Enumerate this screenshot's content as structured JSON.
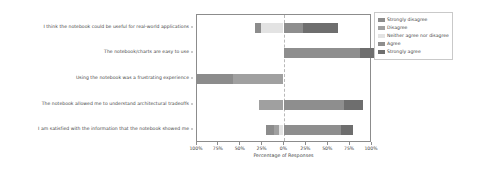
{
  "chart_data": {
    "type": "bar",
    "title": "",
    "subtitle": "",
    "xlabel": "Percentage of Responses",
    "ylabel": "",
    "orientation": "horizontal",
    "stacking": "diverging",
    "grid": false,
    "legend_position": "right",
    "xlim": [
      -100,
      100
    ],
    "xticks": [
      -100,
      -75,
      -50,
      -25,
      0,
      25,
      50,
      75,
      100
    ],
    "xtick_labels": [
      "100%",
      "75%",
      "50%",
      "25%",
      "0%",
      "25%",
      "50%",
      "75%",
      "100%"
    ],
    "center_reference": 0,
    "categories": [
      "I think the notebook could be useful for real-world applications",
      "The notebook/charts are easy to use",
      "Using the notebook was a frustrating experience",
      "The notebook allowed me to understand architectural tradeoffs",
      "I am satisfied with the information that the notebook showed me"
    ],
    "series": [
      {
        "name": "Strongly disagree",
        "color": "#8c8c8c",
        "values": [
          7,
          0,
          42,
          0,
          9
        ]
      },
      {
        "name": "Disagree",
        "color": "#a0a0a0",
        "values": [
          0,
          0,
          58,
          28,
          6
        ]
      },
      {
        "name": "Neither agree nor disagree",
        "color": "#e3e3e3",
        "values": [
          26,
          0,
          0,
          0,
          5
        ]
      },
      {
        "name": "Agree",
        "color": "#8e8e8e",
        "values": [
          23,
          89,
          0,
          70,
          67
        ]
      },
      {
        "name": "Strongly agree",
        "color": "#6e6e6e",
        "values": [
          40,
          18,
          0,
          22,
          13
        ]
      }
    ],
    "bars": [
      {
        "category": "I think the notebook could be useful for real-world applications",
        "segments": [
          {
            "label": "Strongly disagree",
            "value": 7,
            "start": -33,
            "end": -26,
            "color": "#8c8c8c"
          },
          {
            "label": "Neither agree nor disagree",
            "value": 26,
            "start": -26,
            "end": 0,
            "color": "#e3e3e3"
          },
          {
            "label": "Agree",
            "value": 23,
            "start": 0,
            "end": 23,
            "color": "#8e8e8e"
          },
          {
            "label": "Strongly agree",
            "value": 40,
            "start": 23,
            "end": 63,
            "color": "#6e6e6e"
          }
        ]
      },
      {
        "category": "The notebook/charts are easy to use",
        "segments": [
          {
            "label": "Agree",
            "value": 89,
            "start": 0,
            "end": 89,
            "color": "#8e8e8e"
          },
          {
            "label": "Strongly agree",
            "value": 18,
            "start": 89,
            "end": 107,
            "color": "#6e6e6e"
          }
        ]
      },
      {
        "category": "Using the notebook was a frustrating experience",
        "segments": [
          {
            "label": "Strongly disagree",
            "value": 42,
            "start": -100,
            "end": -58,
            "color": "#8c8c8c"
          },
          {
            "label": "Disagree",
            "value": 58,
            "start": -58,
            "end": 0,
            "color": "#a0a0a0"
          }
        ]
      },
      {
        "category": "The notebook allowed me to understand architectural tradeoffs",
        "segments": [
          {
            "label": "Disagree",
            "value": 28,
            "start": -28,
            "end": 0,
            "color": "#a0a0a0"
          },
          {
            "label": "Agree",
            "value": 70,
            "start": 0,
            "end": 70,
            "color": "#8e8e8e"
          },
          {
            "label": "Strongly agree",
            "value": 22,
            "start": 70,
            "end": 92,
            "color": "#6e6e6e"
          }
        ]
      },
      {
        "category": "I am satisfied with the information that the notebook showed me",
        "segments": [
          {
            "label": "Strongly disagree",
            "value": 9,
            "start": -20,
            "end": -11,
            "color": "#8c8c8c"
          },
          {
            "label": "Disagree",
            "value": 6,
            "start": -11,
            "end": -5,
            "color": "#a0a0a0"
          },
          {
            "label": "Neither agree nor disagree",
            "value": 5,
            "start": -5,
            "end": 0,
            "color": "#e3e3e3"
          },
          {
            "label": "Agree",
            "value": 67,
            "start": 0,
            "end": 67,
            "color": "#8e8e8e"
          },
          {
            "label": "Strongly agree",
            "value": 13,
            "start": 67,
            "end": 80,
            "color": "#6e6e6e"
          }
        ]
      }
    ],
    "legend": [
      {
        "label": "Strongly disagree",
        "color": "#8c8c8c"
      },
      {
        "label": "Disagree",
        "color": "#a0a0a0"
      },
      {
        "label": "Neither agree nor disagree",
        "color": "#e3e3e3"
      },
      {
        "label": "Agree",
        "color": "#8e8e8e"
      },
      {
        "label": "Strongly agree",
        "color": "#6e6e6e"
      }
    ],
    "colors": {
      "strongly_disagree": "#8c8c8c",
      "disagree": "#a0a0a0",
      "neither": "#e3e3e3",
      "agree": "#8e8e8e",
      "strongly_agree": "#6e6e6e",
      "axis": "#8c8c8c",
      "text": "#3f3f3f",
      "background": "#ffffff"
    }
  }
}
